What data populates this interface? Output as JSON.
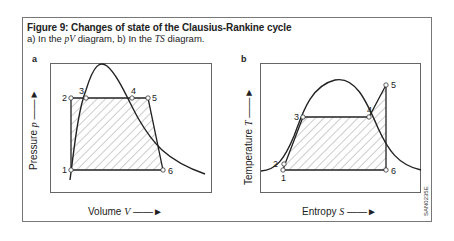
{
  "figure": {
    "title": "Figure 9: Changes of state of the Clausius-Rankine cycle",
    "subtitle_prefix": "a) In the ",
    "subtitle_var1": "pV",
    "subtitle_mid": " diagram, b) In the ",
    "subtitle_var2": "TS",
    "subtitle_suffix": " diagram.",
    "code": "SAN0235E"
  },
  "panels": [
    {
      "label": "a",
      "ylabel": "Pressure",
      "ylabel_var": "p",
      "xlabel": "Volume",
      "xlabel_var": "V",
      "points": [
        "1",
        "2",
        "3",
        "4",
        "5",
        "6"
      ]
    },
    {
      "label": "b",
      "ylabel": "Temperature",
      "ylabel_var": "T",
      "xlabel": "Entropy",
      "xlabel_var": "S",
      "points": [
        "1",
        "2",
        "3",
        "4",
        "5",
        "6"
      ]
    }
  ]
}
